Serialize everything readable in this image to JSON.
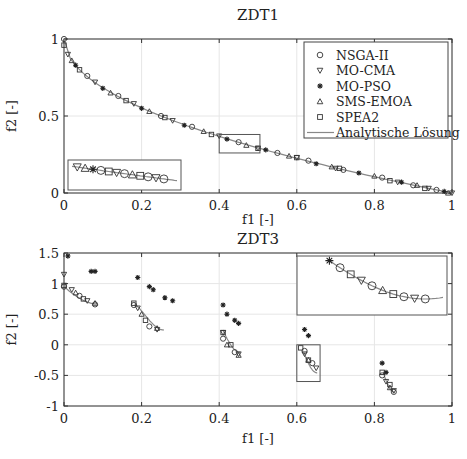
{
  "chart_data": [
    {
      "type": "scatter",
      "title": "ZDT1",
      "xlabel": "f1 [-]",
      "ylabel": "f2 [-]",
      "xlim": [
        0,
        1
      ],
      "ylim": [
        0,
        1
      ],
      "xticks": [
        "0",
        "0.2",
        "0.4",
        "0.6",
        "0.8",
        "1"
      ],
      "yticks": [
        "0",
        "0.5",
        "1"
      ],
      "grid": true,
      "legend_position": "upper right",
      "legend": [
        "NSGA-II",
        "MO-CMA",
        "MO-PSO",
        "SMS-EMOA",
        "SPEA2",
        "Analytische Lösung"
      ],
      "analytic_front": "f2 = 1 - sqrt(f1)",
      "series": [
        {
          "name": "NSGA-II",
          "marker": "circle",
          "x": [
            0.0,
            0.06,
            0.14,
            0.25,
            0.33,
            0.45,
            0.55,
            0.63,
            0.72,
            0.82,
            0.9,
            0.96
          ],
          "y": [
            1.0,
            0.76,
            0.63,
            0.5,
            0.43,
            0.33,
            0.26,
            0.21,
            0.15,
            0.1,
            0.05,
            0.02
          ]
        },
        {
          "name": "MO-CMA",
          "marker": "triangle-down",
          "x": [
            0.01,
            0.08,
            0.18,
            0.28,
            0.4,
            0.5,
            0.6,
            0.7,
            0.86,
            0.94,
            1.0
          ],
          "y": [
            0.9,
            0.72,
            0.58,
            0.47,
            0.37,
            0.29,
            0.23,
            0.16,
            0.07,
            0.03,
            0.0
          ]
        },
        {
          "name": "MO-PSO",
          "marker": "asterisk",
          "x": [
            0.03,
            0.1,
            0.2,
            0.31,
            0.42,
            0.52,
            0.65,
            0.76,
            0.87,
            0.98
          ],
          "y": [
            0.83,
            0.68,
            0.55,
            0.44,
            0.35,
            0.28,
            0.19,
            0.13,
            0.07,
            0.01
          ]
        },
        {
          "name": "SMS-EMOA",
          "marker": "triangle-up",
          "x": [
            0.02,
            0.12,
            0.22,
            0.36,
            0.47,
            0.58,
            0.69,
            0.8,
            0.91,
            0.99
          ],
          "y": [
            0.86,
            0.65,
            0.53,
            0.4,
            0.31,
            0.24,
            0.17,
            0.11,
            0.05,
            0.0
          ]
        },
        {
          "name": "SPEA2",
          "marker": "square",
          "x": [
            0.0,
            0.04,
            0.16,
            0.26,
            0.38,
            0.5,
            0.6,
            0.71,
            0.84,
            0.93
          ],
          "y": [
            0.96,
            0.8,
            0.6,
            0.49,
            0.38,
            0.29,
            0.23,
            0.16,
            0.08,
            0.03
          ]
        }
      ],
      "inset": {
        "source_rect": {
          "x": [
            0.4,
            0.505
          ],
          "y": [
            0.26,
            0.38
          ]
        },
        "placement": "lower left"
      }
    },
    {
      "type": "scatter",
      "title": "ZDT3",
      "xlabel": "f1 [-]",
      "ylabel": "f2 [-]",
      "xlim": [
        0,
        1
      ],
      "ylim": [
        -1,
        1.5
      ],
      "xticks": [
        "0",
        "0.2",
        "0.4",
        "0.6",
        "0.8",
        "1"
      ],
      "yticks": [
        "-1",
        "-0.5",
        "0",
        "0.5",
        "1",
        "1.5"
      ],
      "grid": true,
      "analytic_front": "f2 = 1 - sqrt(f1) - f1*sin(10*pi*f1)",
      "series": [
        {
          "name": "NSGA-II",
          "marker": "circle",
          "x": [
            0.0,
            0.04,
            0.08,
            0.18,
            0.22,
            0.41,
            0.44,
            0.62,
            0.64,
            0.82,
            0.85
          ],
          "y": [
            0.95,
            0.8,
            0.66,
            0.65,
            0.3,
            0.1,
            -0.12,
            -0.1,
            -0.3,
            -0.5,
            -0.77
          ]
        },
        {
          "name": "MO-CMA",
          "marker": "triangle-down",
          "x": [
            0.0,
            0.02,
            0.06,
            0.19,
            0.24,
            0.41,
            0.45,
            0.62,
            0.65,
            0.83,
            0.85
          ],
          "y": [
            1.15,
            0.9,
            0.72,
            0.6,
            0.25,
            0.2,
            -0.15,
            -0.15,
            -0.38,
            -0.6,
            -0.75
          ]
        },
        {
          "name": "MO-PSO",
          "marker": "asterisk",
          "x": [
            0.01,
            0.07,
            0.08,
            0.19,
            0.22,
            0.23,
            0.26,
            0.28,
            0.41,
            0.42,
            0.44,
            0.45,
            0.62,
            0.63,
            0.82,
            0.83
          ],
          "y": [
            1.45,
            1.2,
            1.2,
            1.1,
            0.95,
            0.9,
            0.77,
            0.72,
            0.65,
            0.5,
            0.4,
            0.35,
            0.25,
            0.15,
            -0.3,
            -0.45
          ]
        },
        {
          "name": "SMS-EMOA",
          "marker": "triangle-up",
          "x": [
            0.03,
            0.08,
            0.2,
            0.24,
            0.42,
            0.45,
            0.63,
            0.84
          ],
          "y": [
            0.85,
            0.68,
            0.5,
            0.27,
            0.0,
            -0.17,
            -0.25,
            -0.7
          ]
        },
        {
          "name": "SPEA2",
          "marker": "square",
          "x": [
            0.0,
            0.05,
            0.18,
            0.21,
            0.41,
            0.43,
            0.61,
            0.63,
            0.82,
            0.84
          ],
          "y": [
            0.97,
            0.75,
            0.68,
            0.4,
            0.2,
            0.0,
            -0.05,
            -0.25,
            -0.45,
            -0.65
          ]
        }
      ],
      "inset": {
        "source_rect": {
          "x": [
            0.6,
            0.66
          ],
          "y": [
            -0.6,
            0.0
          ]
        },
        "placement": "upper right"
      }
    }
  ]
}
